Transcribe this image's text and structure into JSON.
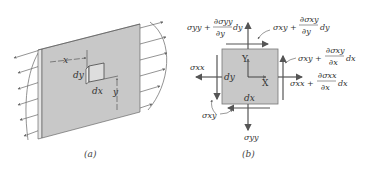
{
  "figure_a": {
    "caption": "(a)",
    "labels": {
      "x": "x",
      "y": "y",
      "dx": "dx",
      "dy": "dy"
    },
    "colors": {
      "plate": "#c8c8c8",
      "edge": "#555555",
      "arrows": "#666666"
    }
  },
  "figure_b": {
    "caption": "(b)",
    "element_labels": {
      "dx": "dx",
      "dy": "dy",
      "X": "X",
      "Y": "Y"
    },
    "stresses": {
      "top_normal": {
        "base": "σyy +",
        "num": "∂σyy",
        "den": "∂y",
        "tail": "dy"
      },
      "top_shear": {
        "base": "σxy +",
        "num": "∂σxy",
        "den": "∂y",
        "tail": "dy"
      },
      "right_shear": {
        "base": "σxy +",
        "num": "∂σxy",
        "den": "∂x",
        "tail": "dx"
      },
      "right_normal": {
        "base": "σxx +",
        "num": "∂σxx",
        "den": "∂x",
        "tail": "dx"
      },
      "left_normal": "σxx",
      "left_shear": "σxy",
      "bottom_normal": "σyy"
    },
    "colors": {
      "element": "#c8c8c8",
      "arrows": "#555555"
    }
  }
}
